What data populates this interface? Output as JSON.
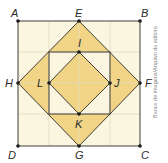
{
  "diagram": {
    "colors": {
      "background": "#fbf6df",
      "grid": "#e3ddba",
      "fill": "#f1d486",
      "stroke": "#2a2a2a"
    },
    "points": {
      "A": {
        "label": "A",
        "x": 18,
        "y": 21
      },
      "B": {
        "label": "B",
        "x": 140,
        "y": 21
      },
      "C": {
        "label": "C",
        "x": 140,
        "y": 146
      },
      "D": {
        "label": "D",
        "x": 18,
        "y": 146
      },
      "E": {
        "label": "E",
        "x": 79,
        "y": 21
      },
      "F": {
        "label": "F",
        "x": 140,
        "y": 83
      },
      "G": {
        "label": "G",
        "x": 79,
        "y": 146
      },
      "H": {
        "label": "H",
        "x": 18,
        "y": 83
      },
      "I": {
        "label": "I",
        "x": 79,
        "y": 52
      },
      "J": {
        "label": "J",
        "x": 110,
        "y": 83
      },
      "K": {
        "label": "K",
        "x": 79,
        "y": 114
      },
      "L": {
        "label": "L",
        "x": 49,
        "y": 83
      }
    },
    "credit": "Banco de imagens/Arquivo da editora"
  }
}
